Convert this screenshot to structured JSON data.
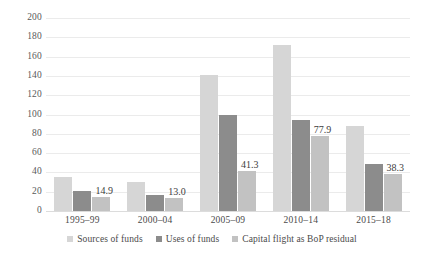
{
  "chart_data": {
    "type": "bar",
    "title": "",
    "subtitle": "",
    "xlabel": "",
    "ylabel": "",
    "ylim": [
      0,
      200
    ],
    "ytick_step": 20,
    "yticks": [
      200,
      180,
      160,
      140,
      120,
      100,
      80,
      60,
      40,
      20,
      0
    ],
    "grid": "horizontal",
    "legend_position": "bottom",
    "categories": [
      "1995–99",
      "2000–04",
      "2005–09",
      "2010–14",
      "2015–18"
    ],
    "series": [
      {
        "name": "Sources of funds",
        "color": "#d6d6d6",
        "values": [
          35,
          30,
          141,
          172,
          88
        ],
        "labels": [
          "",
          "",
          "",
          "",
          ""
        ]
      },
      {
        "name": "Uses of funds",
        "color": "#8c8c8c",
        "values": [
          21,
          17,
          99,
          94,
          49
        ],
        "labels": [
          "",
          "",
          "",
          "",
          ""
        ]
      },
      {
        "name": "Capital flight as BoP residual",
        "color": "#c2c2c2",
        "values": [
          14.9,
          13.0,
          41.3,
          77.9,
          38.3
        ],
        "labels": [
          "14.9",
          "13.0",
          "41.3",
          "77.9",
          "38.3"
        ]
      }
    ]
  },
  "legend": {
    "items": [
      {
        "label": "Sources of funds"
      },
      {
        "label": "Uses of funds"
      },
      {
        "label": "Capital flight as BoP residual"
      }
    ]
  },
  "colors": {
    "series_sources": "#d6d6d6",
    "series_uses": "#8c8c8c",
    "series_capital_flight": "#c2c2c2",
    "gridline": "#ebebeb",
    "axis_text": "#4a4a4a",
    "background": "#ffffff"
  }
}
